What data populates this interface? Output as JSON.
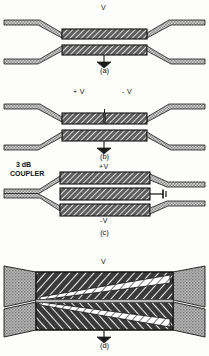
{
  "figure": {
    "panels": [
      {
        "id": "a",
        "caption": "(a)",
        "labels": [
          {
            "name": "voltage-label-v",
            "text": "V"
          }
        ],
        "ground_symbol": "ground-icon",
        "description": "Two parallel hatched slab lines fed by dotted tapered transmission lines"
      },
      {
        "id": "b",
        "caption": "(b)",
        "labels": [
          {
            "name": "voltage-label-plus-v",
            "text": "+ V"
          },
          {
            "name": "voltage-label-minus-v",
            "text": "- V"
          }
        ],
        "ground_symbol": "ground-icon",
        "description": "Upper slab split into two segments biased +V and -V over a common lower slab"
      },
      {
        "id": "c",
        "caption": "(c)",
        "labels": [
          {
            "name": "coupler-label",
            "text": "3 dB\nCOUPLER"
          },
          {
            "name": "coupler-label-line1",
            "text": "3 dB"
          },
          {
            "name": "coupler-label-line2",
            "text": "COUPLER"
          },
          {
            "name": "voltage-label-plus-v",
            "text": "+V"
          },
          {
            "name": "voltage-label-minus-v",
            "text": "-V"
          }
        ],
        "termination_symbol": "short-circuit-icon",
        "description": "Three stacked slabs fed from a 3 dB coupler, terminated in a short at right"
      },
      {
        "id": "d",
        "caption": "(d)",
        "labels": [
          {
            "name": "voltage-label-v",
            "text": "V"
          }
        ],
        "ground_symbol": "ground-icon",
        "description": "Tapered wedge slabs with crossed diagonal hatching, fed by stippled tapers"
      }
    ],
    "colors": {
      "ink": "#111111",
      "paper": "#fdfdfc",
      "hatch_dark": "#2a2a2a",
      "hatch_mid": "#6b6b6b",
      "stipple": "#9a9a9a",
      "stipple_light": "#c9c9c9"
    }
  }
}
